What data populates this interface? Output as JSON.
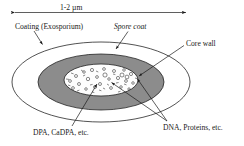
{
  "figure": {
    "background_color": "#ffffff",
    "line_color": "#1a1a1a",
    "shell_fill_color": "#ffffff",
    "coat_fill_color": "#8c8c8c",
    "core_fill_color": "#fdfdfd"
  },
  "scale_bar": {
    "label": "1-2  µm",
    "arrow_style": "double-headed",
    "x_start": 13,
    "x_end": 188,
    "y": 12
  },
  "labels": {
    "coating": "Coating (Exosporium)",
    "spore_coat": "Spore coat",
    "core_wall": "Core wall",
    "dpa": "DPA, CaDPA, etc.",
    "dna": "DNA, Proteins, etc."
  },
  "structures": [
    {
      "name": "exosporium",
      "shape": "ellipse",
      "cx": 101,
      "cy": 82,
      "rx": 89,
      "ry": 40,
      "fill": "#ffffff"
    },
    {
      "name": "spore-coat",
      "shape": "ellipse",
      "cx": 101,
      "cy": 82,
      "rx": 63,
      "ry": 28,
      "fill": "#8c8c8c"
    },
    {
      "name": "core",
      "shape": "ellipse",
      "cx": 101,
      "cy": 80,
      "rx": 37,
      "ry": 16,
      "fill": "#fdfdfd"
    }
  ],
  "leader_lines": [
    {
      "name": "coating-leader",
      "from": [
        34,
        32
      ],
      "to": [
        42,
        44
      ],
      "arrow": true
    },
    {
      "name": "spore-coat-leader",
      "from": [
        127,
        32
      ],
      "to": [
        116,
        48
      ],
      "arrow": true
    },
    {
      "name": "core-wall-leader",
      "from": [
        184,
        45
      ],
      "to": [
        138,
        76
      ],
      "arrow": true
    },
    {
      "name": "dpa-leader",
      "from": [
        72,
        127
      ],
      "to": [
        97,
        83
      ],
      "arrow": true
    },
    {
      "name": "dna-leader-upper",
      "from": [
        166,
        121
      ],
      "to": [
        112,
        82
      ],
      "arrow": true
    },
    {
      "name": "dna-leader-lower",
      "from": [
        166,
        121
      ],
      "to": [
        137,
        79
      ],
      "arrow": true
    }
  ],
  "core_particles": {
    "description": "scattered small open circles and short dashes inside the core representing DPA/CaDPA and DNA/protein content",
    "count": 44
  }
}
